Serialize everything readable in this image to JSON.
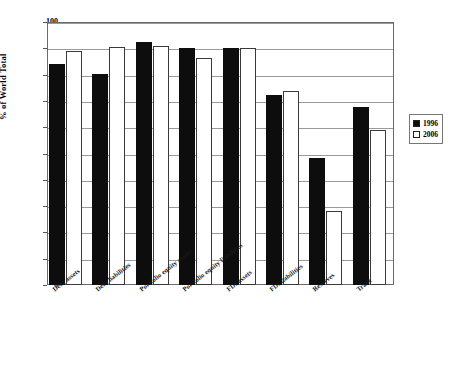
{
  "chart_data": {
    "type": "bar",
    "title": "",
    "xlabel": "",
    "ylabel": "% of World Total",
    "ylim": [
      0,
      100
    ],
    "ytick_step": 10,
    "grid": true,
    "legend_position": "right",
    "categories": [
      "Debt assets",
      "Debt liabilities",
      "Portfolio equity assets",
      "Portfolio equity liabilities",
      "FDI assets",
      "FDI liabilities",
      "Reserves",
      "Trade"
    ],
    "ytick_labels": [
      "0",
      "10",
      "20",
      "30",
      "40",
      "50",
      "60",
      "70",
      "80",
      "90",
      "100"
    ],
    "series": [
      {
        "name": "1996",
        "color": "#0d0d0d",
        "style": "filled",
        "values": [
          84,
          80.3,
          92.5,
          90.2,
          90.3,
          72.2,
          48.4,
          67.7
        ]
      },
      {
        "name": "2006",
        "color": "#ffffff",
        "style": "hollow",
        "values": [
          88.8,
          90.5,
          91,
          86.4,
          90,
          73.8,
          28.3,
          58.8
        ]
      }
    ]
  },
  "legend": {
    "items": [
      {
        "label": "1996",
        "swatch": "filled-square-icon"
      },
      {
        "label": "2006",
        "swatch": "hollow-square-icon"
      }
    ]
  }
}
